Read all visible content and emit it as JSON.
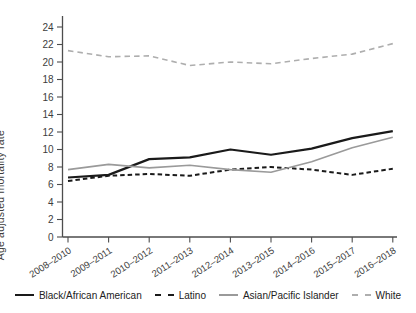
{
  "chart_data": {
    "type": "line",
    "title": "",
    "xlabel": "",
    "ylabel": "Age adjusted mortality rate",
    "ylim": [
      0,
      24
    ],
    "ytick_step": 2,
    "grid": false,
    "legend_position": "bottom",
    "categories": [
      "2008–2010",
      "2009–2011",
      "2010–2012",
      "2011–2013",
      "2012–2014",
      "2013–2015",
      "2014–2016",
      "2015–2017",
      "2016–2018"
    ],
    "series": [
      {
        "name": "Black/African American",
        "color": "#1a1a1a",
        "dash": "solid",
        "width": 2.2,
        "values": [
          6.8,
          7.1,
          8.9,
          9.1,
          10.0,
          9.4,
          10.1,
          11.3,
          12.1
        ]
      },
      {
        "name": "Latino",
        "color": "#1a1a1a",
        "dash": "dashed",
        "width": 2,
        "values": [
          6.4,
          7.0,
          7.2,
          7.0,
          7.7,
          8.0,
          7.7,
          7.1,
          7.8
        ]
      },
      {
        "name": "Asian/Pacific Islander",
        "color": "#9a9a9a",
        "dash": "solid",
        "width": 1.6,
        "values": [
          7.7,
          8.3,
          7.9,
          8.2,
          7.7,
          7.4,
          8.6,
          10.2,
          11.4
        ]
      },
      {
        "name": "White",
        "color": "#aeaeae",
        "dash": "dashed",
        "width": 1.6,
        "values": [
          21.3,
          20.6,
          20.7,
          19.6,
          20.0,
          19.8,
          20.4,
          20.9,
          22.1
        ]
      }
    ],
    "axis_color": "#4d4d4d",
    "tick_label_color": "#3d3d3d"
  }
}
